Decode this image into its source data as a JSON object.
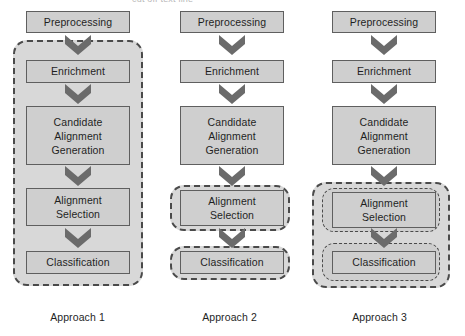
{
  "figure": {
    "top_cropped_text": "cut off text line",
    "node_fill_color": "#cfcfcf",
    "node_border_color": "#5f5f5f",
    "dashed_border_color": "#4a4a4a",
    "arrow_color": "#6b6b6b",
    "background_color": "#ffffff"
  },
  "columns": [
    {
      "caption": "Approach 1",
      "nodes": [
        {
          "label": "Preprocessing"
        },
        {
          "label": "Enrichment"
        },
        {
          "label": "Candidate\nAlignment\nGeneration"
        },
        {
          "label": "Alignment\nSelection"
        },
        {
          "label": "Classification"
        }
      ],
      "grouping": "single dashed box around Enrichment, Candidate Alignment Generation, Alignment Selection and Classification"
    },
    {
      "caption": "Approach 2",
      "nodes": [
        {
          "label": "Preprocessing"
        },
        {
          "label": "Enrichment"
        },
        {
          "label": "Candidate\nAlignment\nGeneration"
        },
        {
          "label": "Alignment\nSelection"
        },
        {
          "label": "Classification"
        }
      ],
      "grouping": "two separate dashed boxes, one around Alignment Selection and one around Classification"
    },
    {
      "caption": "Approach 3",
      "nodes": [
        {
          "label": "Preprocessing"
        },
        {
          "label": "Enrichment"
        },
        {
          "label": "Candidate\nAlignment\nGeneration"
        },
        {
          "label": "Alignment\nSelection"
        },
        {
          "label": "Classification"
        }
      ],
      "grouping": "outer dashed box enclosing two nested dashed boxes around Alignment Selection and Classification"
    }
  ],
  "node_labels": {
    "preprocessing": "Preprocessing",
    "enrichment": "Enrichment",
    "candidate_line1": "Candidate",
    "candidate_line2": "Alignment",
    "candidate_line3": "Generation",
    "selection_line1": "Alignment",
    "selection_line2": "Selection",
    "classification": "Classification"
  }
}
